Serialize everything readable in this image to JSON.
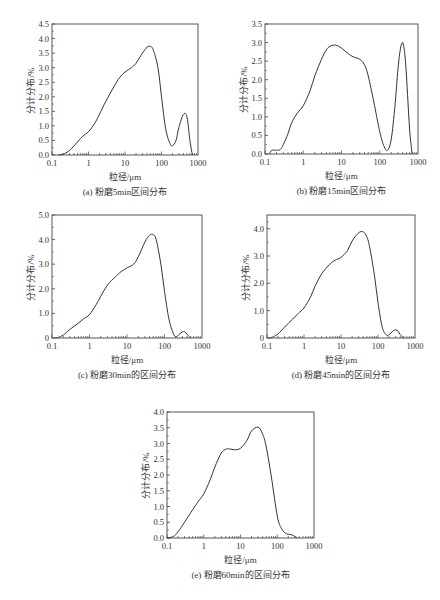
{
  "chart_data": [
    {
      "id": "a",
      "type": "line",
      "title": "(a) 粉磨5min区间分布",
      "xlabel": "粒径/μm",
      "ylabel": "分计分布/%",
      "xscale": "log",
      "xlim": [
        0.1,
        1000
      ],
      "ylim": [
        0,
        4.5
      ],
      "xticks": [
        "0.1",
        "1",
        "10",
        "100",
        "1000"
      ],
      "yticks": [
        "0.0",
        "0.5",
        "1.0",
        "1.5",
        "2.0",
        "2.5",
        "3.0",
        "3.5",
        "4.0",
        "4.5"
      ],
      "ytick_values": [
        0,
        0.5,
        1.0,
        1.5,
        2.0,
        2.5,
        3.0,
        3.5,
        4.0,
        4.5
      ],
      "grid": false,
      "frame": {
        "left": 52,
        "top": 24,
        "right": 198,
        "bottom": 155
      },
      "x": [
        0.15,
        0.2,
        0.3,
        0.5,
        0.7,
        1,
        1.5,
        2,
        3,
        5,
        7,
        10,
        15,
        20,
        30,
        40,
        50,
        60,
        80,
        100,
        130,
        170,
        200,
        250,
        300,
        400,
        500,
        600,
        700
      ],
      "values": [
        0.0,
        0.03,
        0.15,
        0.45,
        0.65,
        0.8,
        1.1,
        1.4,
        1.85,
        2.35,
        2.65,
        2.85,
        3.0,
        3.15,
        3.5,
        3.7,
        3.73,
        3.6,
        3.0,
        2.0,
        0.9,
        0.4,
        0.32,
        0.5,
        0.95,
        1.4,
        1.3,
        0.5,
        0.0
      ]
    },
    {
      "id": "b",
      "type": "line",
      "title": "(b) 粉磨15min区间分布",
      "xlabel": "粒径/μm",
      "ylabel": "分计分布/%",
      "xscale": "log",
      "xlim": [
        0.1,
        1000
      ],
      "ylim": [
        0,
        3.5
      ],
      "xticks": [
        "0.1",
        "1",
        "10",
        "100",
        "1000"
      ],
      "yticks": [
        "0.0",
        "0.5",
        "1.0",
        "1.5",
        "2.0",
        "2.5",
        "3.0",
        "3.5"
      ],
      "ytick_values": [
        0,
        0.5,
        1.0,
        1.5,
        2.0,
        2.5,
        3.0,
        3.5
      ],
      "grid": false,
      "frame": {
        "left": 265,
        "top": 24,
        "right": 418,
        "bottom": 154
      },
      "x": [
        0.13,
        0.15,
        0.2,
        0.25,
        0.3,
        0.4,
        0.5,
        0.7,
        1,
        1.5,
        2,
        3,
        4,
        5,
        7,
        10,
        15,
        20,
        30,
        40,
        50,
        70,
        100,
        130,
        160,
        200,
        250,
        300,
        350,
        400,
        450,
        500,
        600,
        700
      ],
      "values": [
        0.0,
        0.1,
        0.1,
        0.12,
        0.25,
        0.55,
        0.85,
        1.1,
        1.3,
        1.7,
        2.1,
        2.55,
        2.8,
        2.9,
        2.93,
        2.85,
        2.7,
        2.62,
        2.55,
        2.4,
        2.1,
        1.4,
        0.6,
        0.2,
        0.1,
        0.4,
        1.3,
        2.3,
        2.85,
        3.0,
        2.7,
        2.1,
        0.7,
        0.0
      ]
    },
    {
      "id": "c",
      "type": "line",
      "title": "(c) 粉磨30min的区间分布",
      "xlabel": "粒径/μm",
      "ylabel": "分计分布/%",
      "xscale": "log",
      "xlim": [
        0.1,
        1000
      ],
      "ylim": [
        0,
        5.0
      ],
      "xticks": [
        "0.1",
        "1",
        "10",
        "100",
        "1000"
      ],
      "yticks": [
        "0",
        "1.0",
        "2.0",
        "3.0",
        "4.0",
        "5.0"
      ],
      "ytick_values": [
        0,
        1.0,
        2.0,
        3.0,
        4.0,
        5.0
      ],
      "grid": false,
      "frame": {
        "left": 52,
        "top": 215,
        "right": 202,
        "bottom": 338
      },
      "x": [
        0.12,
        0.15,
        0.2,
        0.3,
        0.5,
        0.7,
        1,
        1.5,
        2,
        3,
        5,
        7,
        10,
        15,
        20,
        30,
        40,
        50,
        60,
        80,
        100,
        130,
        170,
        200,
        250,
        300,
        350,
        400,
        500
      ],
      "values": [
        0.0,
        0.03,
        0.12,
        0.35,
        0.6,
        0.78,
        0.95,
        1.35,
        1.7,
        2.15,
        2.5,
        2.7,
        2.85,
        3.0,
        3.3,
        3.9,
        4.18,
        4.2,
        4.0,
        3.0,
        1.9,
        0.8,
        0.2,
        0.05,
        0.15,
        0.25,
        0.25,
        0.15,
        0.0
      ]
    },
    {
      "id": "d",
      "type": "line",
      "title": "(d) 粉磨45min的区间分布",
      "xlabel": "粒径/μm",
      "ylabel": "分计分布/%",
      "xscale": "log",
      "xlim": [
        0.1,
        1000
      ],
      "ylim": [
        0,
        4.5
      ],
      "xticks": [
        "0.1",
        "1",
        "10",
        "100",
        "1000"
      ],
      "yticks": [
        "0",
        "1.0",
        "2.0",
        "3.0",
        "4.0"
      ],
      "ytick_values": [
        0,
        1.0,
        2.0,
        3.0,
        4.0
      ],
      "grid": false,
      "frame": {
        "left": 267,
        "top": 215,
        "right": 415,
        "bottom": 338
      },
      "x": [
        0.12,
        0.15,
        0.2,
        0.3,
        0.5,
        0.7,
        1,
        1.5,
        2,
        3,
        5,
        7,
        10,
        15,
        20,
        30,
        40,
        50,
        60,
        80,
        100,
        130,
        170,
        200,
        250,
        300,
        350,
        400,
        500
      ],
      "values": [
        0.0,
        0.05,
        0.15,
        0.4,
        0.7,
        0.9,
        1.1,
        1.5,
        1.9,
        2.35,
        2.7,
        2.85,
        2.95,
        3.2,
        3.55,
        3.85,
        3.88,
        3.7,
        3.3,
        2.3,
        1.3,
        0.4,
        0.1,
        0.12,
        0.25,
        0.3,
        0.25,
        0.12,
        0.0
      ]
    },
    {
      "id": "e",
      "type": "line",
      "title": "(e) 粉磨60min的区间分布",
      "xlabel": "粒径/μm",
      "ylabel": "分计分布/%",
      "xscale": "log",
      "xlim": [
        0.1,
        1000
      ],
      "ylim": [
        0,
        4.0
      ],
      "xticks": [
        "0.1",
        "1",
        "10",
        "100",
        "1000"
      ],
      "yticks": [
        "0.0",
        "0.5",
        "1.0",
        "1.5",
        "2.0",
        "2.5",
        "3.0",
        "3.5",
        "4.0"
      ],
      "ytick_values": [
        0,
        0.5,
        1.0,
        1.5,
        2.0,
        2.5,
        3.0,
        3.5,
        4.0
      ],
      "grid": false,
      "frame": {
        "left": 167,
        "top": 412,
        "right": 314,
        "bottom": 538
      },
      "x": [
        0.1,
        0.15,
        0.2,
        0.3,
        0.5,
        0.7,
        1,
        1.5,
        2,
        3,
        4,
        5,
        7,
        10,
        15,
        20,
        30,
        40,
        50,
        70,
        100,
        130,
        170,
        200,
        250,
        300,
        350
      ],
      "values": [
        0.0,
        0.05,
        0.2,
        0.5,
        0.9,
        1.15,
        1.4,
        1.85,
        2.25,
        2.7,
        2.82,
        2.83,
        2.8,
        2.85,
        3.1,
        3.4,
        3.52,
        3.3,
        2.9,
        1.9,
        0.7,
        0.3,
        0.15,
        0.12,
        0.1,
        0.05,
        0.0
      ]
    }
  ]
}
